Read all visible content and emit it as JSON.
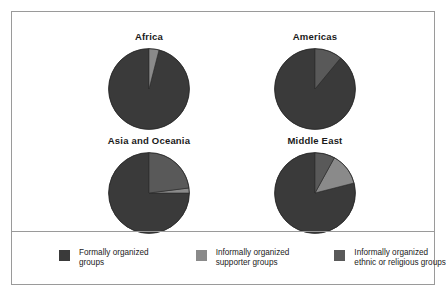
{
  "figure": {
    "border_color": "#9a9a9a",
    "background": "#ffffff"
  },
  "colors": {
    "formal": "#3a3a3a",
    "supporter": "#8a8a8a",
    "ethnic": "#595959",
    "slice_edge": "#2b2b2b"
  },
  "legend": {
    "items": [
      {
        "swatch_name": "legend-swatch-formally-organized-groups",
        "color": "#3a3a3a",
        "line1": "Formally organized",
        "line2": "groups"
      },
      {
        "swatch_name": "legend-swatch-informally-organized-supporter-groups",
        "color": "#8a8a8a",
        "line1": "Informally organized",
        "line2": "supporter groups"
      },
      {
        "swatch_name": "legend-swatch-informally-organized-ethnic-or-religious-groups",
        "color": "#595959",
        "line1": "Informally organized",
        "line2": "ethnic or religious groups"
      }
    ]
  },
  "chart_data": {
    "type": "pie",
    "title": "",
    "legend_position": "bottom",
    "series_labels": [
      "Formally organized groups",
      "Informally organized supporter groups",
      "Informally organized ethnic or religious groups"
    ],
    "series_colors": [
      "#3a3a3a",
      "#8a8a8a",
      "#595959"
    ],
    "units": "percent",
    "start_angle_deg": 90,
    "direction": "counterclockwise",
    "charts": [
      {
        "title": "Africa",
        "categories": [
          "Formally organized groups",
          "Informally organized supporter groups",
          "Informally organized ethnic or religious groups"
        ],
        "values": [
          96,
          4,
          0
        ]
      },
      {
        "title": "Americas",
        "categories": [
          "Formally organized groups",
          "Informally organized supporter groups",
          "Informally organized ethnic or religious groups"
        ],
        "values": [
          89,
          0,
          11
        ]
      },
      {
        "title": "Asia and Oceania",
        "categories": [
          "Formally organized groups",
          "Informally organized supporter groups",
          "Informally organized ethnic or religious groups"
        ],
        "values": [
          75,
          2,
          23
        ]
      },
      {
        "title": "Middle East",
        "categories": [
          "Formally organized groups",
          "Informally organized supporter groups",
          "Informally organized ethnic or religious groups"
        ],
        "values": [
          79,
          13,
          8
        ]
      }
    ]
  }
}
